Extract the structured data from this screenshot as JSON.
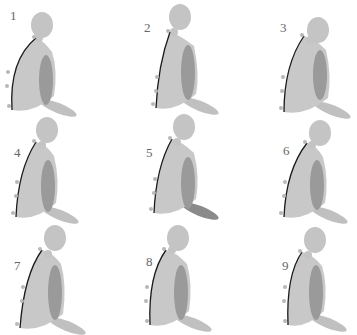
{
  "figure": {
    "colors": {
      "body": "#c8c8c8",
      "head": "#c4c4c4",
      "arm": "#9a9a9a",
      "thigh": "#c0c0c0",
      "thigh_highlight": "#8a8a8a",
      "spine_line": "#1a1a1a",
      "markers": "#b8b8b8",
      "label": "#666666"
    },
    "panels": [
      {
        "label": "1",
        "x": 0,
        "y": 0,
        "num": [
          10,
          8
        ],
        "headX": 42,
        "headY": 25,
        "neckX": 37,
        "neckY": 38,
        "backTop": [
          36,
          38
        ],
        "backMid": [
          13,
          70
        ],
        "backBot": [
          12,
          110
        ],
        "armX": 40,
        "armY": 55,
        "armH": 50,
        "thigh": "normal"
      },
      {
        "label": "2",
        "x": 120,
        "y": 0,
        "num": [
          24,
          20
        ],
        "headX": 60,
        "headY": 17,
        "neckX": 52,
        "neckY": 32,
        "backTop": [
          50,
          32
        ],
        "backMid": [
          42,
          75
        ],
        "backBot": [
          36,
          108
        ],
        "armX": 62,
        "armY": 45,
        "armH": 55,
        "thigh": "normal"
      },
      {
        "label": "3",
        "x": 240,
        "y": 0,
        "num": [
          40,
          20
        ],
        "headX": 78,
        "headY": 30,
        "neckX": 68,
        "neckY": 40,
        "backTop": [
          64,
          36
        ],
        "backMid": [
          48,
          75
        ],
        "backBot": [
          44,
          112
        ],
        "armX": 74,
        "armY": 50,
        "armH": 50,
        "thigh": "normal"
      },
      {
        "label": "4",
        "x": 0,
        "y": 105,
        "num": [
          14,
          40
        ],
        "headX": 47,
        "headY": 25,
        "neckX": 40,
        "neckY": 40,
        "backTop": [
          36,
          37
        ],
        "backMid": [
          22,
          75
        ],
        "backBot": [
          16,
          112
        ],
        "armX": 42,
        "armY": 55,
        "armH": 52,
        "thigh": "normal"
      },
      {
        "label": "5",
        "x": 120,
        "y": 105,
        "num": [
          26,
          40
        ],
        "headX": 64,
        "headY": 22,
        "neckX": 55,
        "neckY": 37,
        "backTop": [
          52,
          34
        ],
        "backMid": [
          40,
          72
        ],
        "backBot": [
          34,
          108
        ],
        "armX": 62,
        "armY": 52,
        "armH": 52,
        "thigh": "dark"
      },
      {
        "label": "6",
        "x": 240,
        "y": 105,
        "num": [
          43,
          38
        ],
        "headX": 80,
        "headY": 28,
        "neckX": 70,
        "neckY": 40,
        "backTop": [
          67,
          38
        ],
        "backMid": [
          50,
          75
        ],
        "backBot": [
          44,
          112
        ],
        "armX": 71,
        "armY": 55,
        "armH": 50,
        "thigh": "normal"
      },
      {
        "label": "7",
        "x": 0,
        "y": 220,
        "num": [
          14,
          38
        ],
        "headX": 55,
        "headY": 18,
        "neckX": 46,
        "neckY": 34,
        "backTop": [
          42,
          30
        ],
        "backMid": [
          28,
          65
        ],
        "backBot": [
          20,
          108
        ],
        "armX": 49,
        "armY": 45,
        "armH": 55,
        "thigh": "normal"
      },
      {
        "label": "8",
        "x": 120,
        "y": 220,
        "num": [
          26,
          34
        ],
        "headX": 58,
        "headY": 18,
        "neckX": 50,
        "neckY": 30,
        "backTop": [
          46,
          30
        ],
        "backMid": [
          32,
          65
        ],
        "backBot": [
          30,
          105
        ],
        "armX": 55,
        "armY": 45,
        "armH": 55,
        "thigh": "normal"
      },
      {
        "label": "9",
        "x": 240,
        "y": 220,
        "num": [
          42,
          38
        ],
        "headX": 75,
        "headY": 20,
        "neckX": 66,
        "neckY": 35,
        "backTop": [
          62,
          32
        ],
        "backMid": [
          50,
          65
        ],
        "backBot": [
          48,
          105
        ],
        "armX": 70,
        "armY": 45,
        "armH": 55,
        "thigh": "normal"
      }
    ]
  }
}
